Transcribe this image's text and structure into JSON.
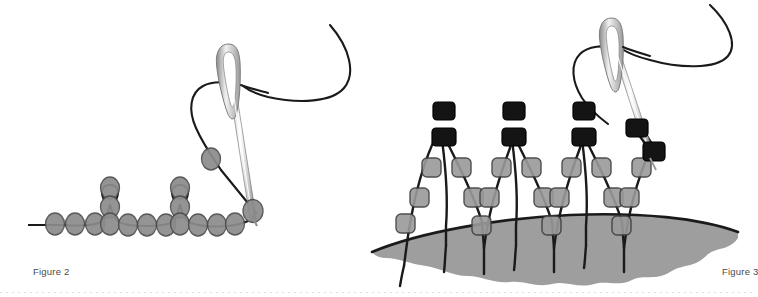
{
  "page": {
    "width": 754,
    "height": 297,
    "background_color": "#ffffff"
  },
  "colors": {
    "thread": "#1a1a1a",
    "round_bead_fill": "#8c8c8c",
    "round_bead_stroke": "#4d4d4d",
    "square_bead_fill": "#9a9a9a",
    "square_bead_stroke": "#3d3d3d",
    "black_bead_fill": "#141414",
    "black_bead_stroke": "#000000",
    "fabric_fill": "#9e9e9e",
    "fabric_stroke": "#1a1a1a",
    "needle_light": "#ffffff",
    "needle_mid": "#d0d0d0",
    "needle_dark": "#6e6e6e",
    "caption_text": "#4a4a4a"
  },
  "figures": [
    {
      "id": "figure-2",
      "caption": "Figure 2",
      "description": "Flat row of round beads on a thread with two raised picot loops, needle with thread exiting at the right end",
      "bead_shape": "ellipse",
      "bead_color": "#8c8c8c",
      "base_beads": [
        {
          "cx": 55,
          "cy": 223
        },
        {
          "cx": 75,
          "cy": 223
        },
        {
          "cx": 95,
          "cy": 223
        },
        {
          "cx": 114,
          "cy": 222
        },
        {
          "cx": 133,
          "cy": 224
        },
        {
          "cx": 152,
          "cy": 224
        },
        {
          "cx": 171,
          "cy": 223
        },
        {
          "cx": 192,
          "cy": 222
        },
        {
          "cx": 211,
          "cy": 223
        },
        {
          "cx": 229,
          "cy": 223
        }
      ],
      "picots": [
        {
          "top_cx": 110,
          "top_cy": 188,
          "mid_cx": 110,
          "mid_cy": 207
        },
        {
          "top_cx": 180,
          "top_cy": 188,
          "mid_cx": 180,
          "mid_cy": 207
        }
      ],
      "upper_beads": [
        {
          "cx": 218,
          "cy": 204
        },
        {
          "cx": 253,
          "cy": 211
        }
      ],
      "needle": {
        "tip_x": 258,
        "tip_y": 216,
        "eye_x": 238,
        "eye_y": 56,
        "angle_deg": 7
      }
    },
    {
      "id": "figure-3",
      "caption": "Figure 3",
      "description": "Netted beadwork of square beads in zigzag rows over curved fabric, black beads at the apex of each peak, needle at right",
      "bead_shape": "rounded-square",
      "base_bead_color": "#9a9a9a",
      "accent_bead_color": "#141414",
      "peaks": [
        {
          "apex_x": 442,
          "apex_y": 132,
          "stitch_x": 444,
          "stitch_y": 244
        },
        {
          "apex_x": 512,
          "apex_y": 132,
          "stitch_x": 514,
          "stitch_y": 244
        },
        {
          "apex_x": 582,
          "apex_y": 132,
          "stitch_x": 584,
          "stitch_y": 244
        }
      ],
      "right_cluster": {
        "upper_x": 638,
        "upper_y": 128,
        "lower_x": 652,
        "lower_y": 152
      },
      "fabric": {
        "top_y": 226,
        "left_x": 372,
        "right_x": 738,
        "scallop_count": 6
      },
      "needle": {
        "tip_x": 652,
        "tip_y": 160,
        "eye_x": 630,
        "eye_y": 30,
        "angle_deg": 8
      }
    }
  ],
  "captions": {
    "figure2": "Figure 2",
    "figure3": "Figure 3"
  }
}
